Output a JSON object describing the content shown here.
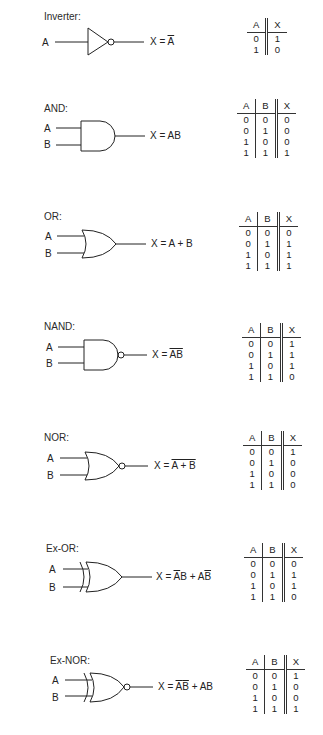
{
  "gates": [
    {
      "id": "inverter",
      "title": "Inverter:",
      "inputs": [
        "A"
      ],
      "expression_prefix": "X = ",
      "expression": "A",
      "expression_parts": [
        {
          "t": "A",
          "over": true
        }
      ],
      "truth_table": {
        "headers": [
          "A",
          "X"
        ],
        "rows": [
          [
            "0",
            "1"
          ],
          [
            "1",
            "0"
          ]
        ]
      }
    },
    {
      "id": "and",
      "title": "AND:",
      "inputs": [
        "A",
        "B"
      ],
      "expression_prefix": "X = ",
      "expression": "AB",
      "expression_parts": [
        {
          "t": "AB",
          "over": false
        }
      ],
      "truth_table": {
        "headers": [
          "A",
          "B",
          "X"
        ],
        "rows": [
          [
            "0",
            "0",
            "0"
          ],
          [
            "0",
            "1",
            "0"
          ],
          [
            "1",
            "0",
            "0"
          ],
          [
            "1",
            "1",
            "1"
          ]
        ]
      }
    },
    {
      "id": "or",
      "title": "OR:",
      "inputs": [
        "A",
        "B"
      ],
      "expression_prefix": "X = ",
      "expression": "A + B",
      "expression_parts": [
        {
          "t": "A + B",
          "over": false
        }
      ],
      "truth_table": {
        "headers": [
          "A",
          "B",
          "X"
        ],
        "rows": [
          [
            "0",
            "0",
            "0"
          ],
          [
            "0",
            "1",
            "1"
          ],
          [
            "1",
            "0",
            "1"
          ],
          [
            "1",
            "1",
            "1"
          ]
        ]
      }
    },
    {
      "id": "nand",
      "title": "NAND:",
      "inputs": [
        "A",
        "B"
      ],
      "expression_prefix": "X = ",
      "expression": "AB (overlined)",
      "expression_parts": [
        {
          "t": "AB",
          "over": true
        }
      ],
      "truth_table": {
        "headers": [
          "A",
          "B",
          "X"
        ],
        "rows": [
          [
            "0",
            "0",
            "1"
          ],
          [
            "0",
            "1",
            "1"
          ],
          [
            "1",
            "0",
            "1"
          ],
          [
            "1",
            "1",
            "0"
          ]
        ]
      }
    },
    {
      "id": "nor",
      "title": "NOR:",
      "inputs": [
        "A",
        "B"
      ],
      "expression_prefix": "X = ",
      "expression": "A + B (overlined)",
      "expression_parts": [
        {
          "t": "A + B",
          "over": true
        }
      ],
      "truth_table": {
        "headers": [
          "A",
          "B",
          "X"
        ],
        "rows": [
          [
            "0",
            "0",
            "1"
          ],
          [
            "0",
            "1",
            "0"
          ],
          [
            "1",
            "0",
            "0"
          ],
          [
            "1",
            "1",
            "0"
          ]
        ]
      }
    },
    {
      "id": "xor",
      "title": "Ex-OR:",
      "inputs": [
        "A",
        "B"
      ],
      "expression_prefix": "X = ",
      "expression": "A̅B + AB̅",
      "expression_parts": [
        {
          "t": "A",
          "over": true
        },
        {
          "t": "B + A",
          "over": false
        },
        {
          "t": "B",
          "over": true
        }
      ],
      "truth_table": {
        "headers": [
          "A",
          "B",
          "X"
        ],
        "rows": [
          [
            "0",
            "0",
            "0"
          ],
          [
            "0",
            "1",
            "1"
          ],
          [
            "1",
            "0",
            "1"
          ],
          [
            "1",
            "1",
            "0"
          ]
        ]
      }
    },
    {
      "id": "xnor",
      "title": "Ex-NOR:",
      "inputs": [
        "A",
        "B"
      ],
      "expression_prefix": "X = ",
      "expression": "A̅B̅ + AB",
      "expression_parts": [
        {
          "t": "A",
          "over": true
        },
        {
          "t": "B",
          "over": true
        },
        {
          "t": " + AB",
          "over": false
        }
      ],
      "truth_table": {
        "headers": [
          "A",
          "B",
          "X"
        ],
        "rows": [
          [
            "0",
            "0",
            "1"
          ],
          [
            "0",
            "1",
            "0"
          ],
          [
            "1",
            "0",
            "0"
          ],
          [
            "1",
            "1",
            "1"
          ]
        ]
      }
    }
  ]
}
